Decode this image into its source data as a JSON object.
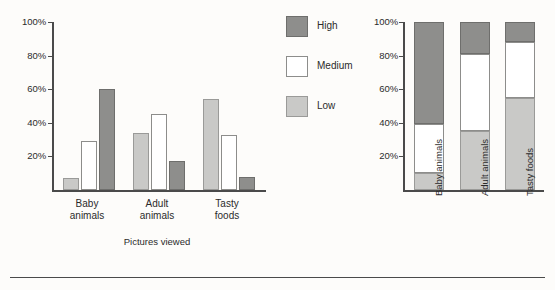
{
  "figure": {
    "footer_rule": true
  },
  "legend": {
    "position": "center",
    "entries": [
      {
        "label": "High",
        "swatch": "high",
        "color": "#8e8e8c"
      },
      {
        "label": "Medium",
        "swatch": "medium",
        "color": "#ffffff"
      },
      {
        "label": "Low",
        "swatch": "low",
        "color": "#c9c9c7"
      }
    ]
  },
  "chart_data": [
    {
      "id": "grouped",
      "type": "bar",
      "title": "",
      "subtitle": "",
      "xlabel": "Pictures viewed",
      "ylabel": "",
      "ylim": [
        0,
        100
      ],
      "ytick_labels": [
        "100%",
        "80%",
        "60%",
        "40%",
        "20%"
      ],
      "yticks": [
        100,
        80,
        60,
        40,
        20
      ],
      "grid": false,
      "legend_position": "center-right",
      "categories": [
        "Baby\nanimals",
        "Adult\nanimals",
        "Tasty\nfoods"
      ],
      "category_labels_flat": [
        "Baby animals",
        "Adult animals",
        "Tasty foods"
      ],
      "series": [
        {
          "name": "Low",
          "key": "low",
          "color": "#c9c9c7",
          "values": [
            7,
            34,
            54
          ]
        },
        {
          "name": "Medium",
          "key": "medium",
          "color": "#ffffff",
          "values": [
            29,
            45,
            33
          ]
        },
        {
          "name": "High",
          "key": "high",
          "color": "#8e8e8c",
          "values": [
            60,
            17,
            8
          ]
        }
      ]
    },
    {
      "id": "stacked",
      "type": "bar",
      "stacked": true,
      "title": "",
      "xlabel": "",
      "ylabel": "",
      "ylim": [
        0,
        100
      ],
      "ytick_labels": [
        "100%",
        "80%",
        "60%",
        "40%",
        "20%"
      ],
      "yticks": [
        100,
        80,
        60,
        40,
        20
      ],
      "grid": false,
      "categories": [
        "Baby animals",
        "Adult animals",
        "Tasty foods"
      ],
      "series": [
        {
          "name": "Low",
          "key": "low",
          "color": "#c9c9c7",
          "values": [
            10,
            35,
            55
          ]
        },
        {
          "name": "Medium",
          "key": "medium",
          "color": "#ffffff",
          "values": [
            29,
            46,
            33
          ]
        },
        {
          "name": "High",
          "key": "high",
          "color": "#8e8e8c",
          "values": [
            61,
            19,
            12
          ]
        }
      ]
    }
  ]
}
